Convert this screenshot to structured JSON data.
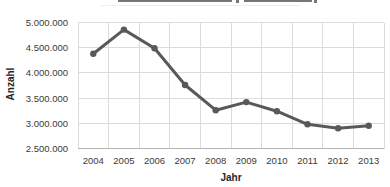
{
  "chart_data": {
    "type": "line",
    "categories": [
      "2004",
      "2005",
      "2006",
      "2007",
      "2008",
      "2009",
      "2010",
      "2011",
      "2012",
      "2013"
    ],
    "series": [
      {
        "name": "Anzahl",
        "values": [
          4380000,
          4860000,
          4490000,
          3760000,
          3260000,
          3420000,
          3240000,
          2980000,
          2900000,
          2950000
        ]
      }
    ],
    "xlabel": "Jahr",
    "ylabel": "Anzahl",
    "ylim": [
      2500000,
      5000000
    ],
    "ytick_interval": 500000,
    "ytick_labels_top_to_bottom": [
      "5.000.000",
      "4.500.000",
      "4.000.000",
      "3.500.000",
      "3.000.000",
      "2.500.000"
    ],
    "grid": "both",
    "legend": "none",
    "title_cropped_out_of_frame": true,
    "marker": "circle",
    "colors": {
      "line": "#595959",
      "marker": "#595959",
      "grid": "#dcdcdc",
      "axis": "#b3b3b3",
      "tick_text": "#3a3a3a",
      "axis_title_text": "#262626"
    }
  }
}
